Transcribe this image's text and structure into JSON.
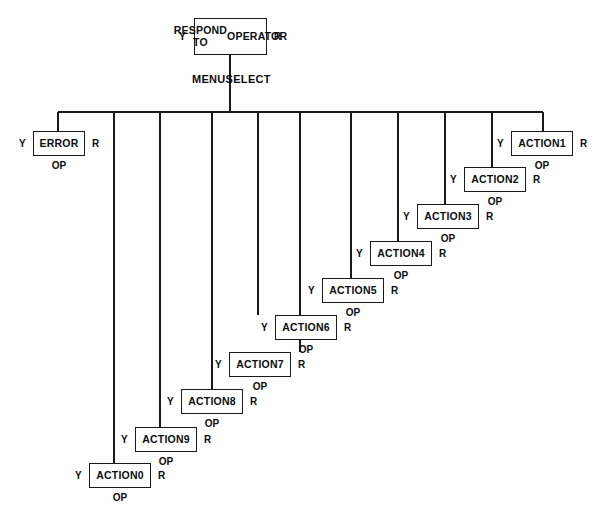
{
  "diagram": {
    "title_node": {
      "label": "RESPOND TO\nOPERATOR",
      "line1": "RESPOND TO",
      "line2": "OPERATOR",
      "yes": "Y",
      "ret": "R"
    },
    "bus_label": "MENUSELECT",
    "labels": {
      "yes": "Y",
      "ret": "R",
      "op": "OP"
    },
    "colors": {
      "line": "#1a1a1a",
      "text": "#0d0d0d",
      "background": "#ffffff"
    },
    "nodes": [
      {
        "id": "error",
        "label": "ERROR",
        "yes": "Y",
        "ret": "R",
        "op": "OP"
      },
      {
        "id": "action1",
        "label": "ACTION1",
        "yes": "Y",
        "ret": "R",
        "op": "OP"
      },
      {
        "id": "action2",
        "label": "ACTION2",
        "yes": "Y",
        "ret": "R",
        "op": "OP"
      },
      {
        "id": "action3",
        "label": "ACTION3",
        "yes": "Y",
        "ret": "R",
        "op": "OP"
      },
      {
        "id": "action4",
        "label": "ACTION4",
        "yes": "Y",
        "ret": "R",
        "op": "OP"
      },
      {
        "id": "action5",
        "label": "ACTION5",
        "yes": "Y",
        "ret": "R",
        "op": "OP"
      },
      {
        "id": "action6",
        "label": "ACTION6",
        "yes": "Y",
        "ret": "R",
        "op": "OP"
      },
      {
        "id": "action7",
        "label": "ACTION7",
        "yes": "Y",
        "ret": "R",
        "op": "OP"
      },
      {
        "id": "action8",
        "label": "ACTION8",
        "yes": "Y",
        "ret": "R",
        "op": "OP"
      },
      {
        "id": "action9",
        "label": "ACTION9",
        "yes": "Y",
        "ret": "R",
        "op": "OP"
      },
      {
        "id": "action0",
        "label": "ACTION0",
        "yes": "Y",
        "ret": "R",
        "op": "OP"
      }
    ]
  }
}
